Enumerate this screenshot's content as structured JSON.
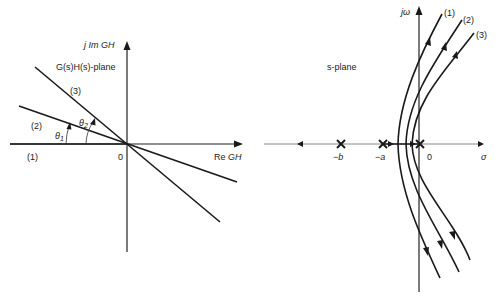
{
  "left_plot": {
    "title": "G(s)H(s)-plane",
    "y_axis_label": {
      "prefix": "j Im ",
      "var": "GH"
    },
    "x_axis_label": {
      "prefix": "Re ",
      "var": "GH"
    },
    "origin_label": "0",
    "lines": [
      {
        "id": "1",
        "label": "(1)"
      },
      {
        "id": "2",
        "label": "(2)"
      },
      {
        "id": "3",
        "label": "(3)"
      }
    ],
    "angles": [
      {
        "symbol": "θ",
        "sub": "1"
      },
      {
        "symbol": "θ",
        "sub": "2"
      }
    ]
  },
  "right_plot": {
    "title": "s-plane",
    "y_axis_label": "jω",
    "x_axis_label": "σ",
    "origin_label": "0",
    "poles": [
      {
        "label": "−b"
      },
      {
        "label": "−a"
      },
      {
        "label": ""
      }
    ],
    "loci": [
      {
        "id": "1",
        "label": "(1)"
      },
      {
        "id": "2",
        "label": "(2)"
      },
      {
        "id": "3",
        "label": "(3)"
      }
    ]
  }
}
